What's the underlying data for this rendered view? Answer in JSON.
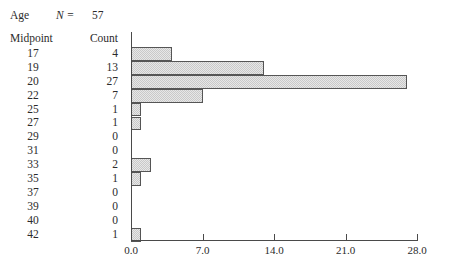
{
  "header": {
    "variable_label": "Age",
    "n_label": "N =",
    "n_value": "57"
  },
  "table": {
    "columns": [
      "Midpoint",
      "Count"
    ],
    "rows": [
      {
        "midpoint": "17",
        "count": "4"
      },
      {
        "midpoint": "19",
        "count": "13"
      },
      {
        "midpoint": "20",
        "count": "27"
      },
      {
        "midpoint": "22",
        "count": "7"
      },
      {
        "midpoint": "25",
        "count": "1"
      },
      {
        "midpoint": "27",
        "count": "1"
      },
      {
        "midpoint": "29",
        "count": "0"
      },
      {
        "midpoint": "31",
        "count": "0"
      },
      {
        "midpoint": "33",
        "count": "2"
      },
      {
        "midpoint": "35",
        "count": "1"
      },
      {
        "midpoint": "37",
        "count": "0"
      },
      {
        "midpoint": "39",
        "count": "0"
      },
      {
        "midpoint": "40",
        "count": "0"
      },
      {
        "midpoint": "42",
        "count": "1"
      }
    ]
  },
  "axis": {
    "tick_labels": [
      "0.0",
      "7.0",
      "14.0",
      "21.0",
      "28.0"
    ],
    "tick_values": [
      0,
      7,
      14,
      21,
      28
    ]
  },
  "colors": {
    "bar_fill": "#c9c9c9",
    "bar_border": "#555555",
    "axis": "#4a4a4a",
    "text": "#2b2b2b",
    "background": "#ffffff"
  },
  "chart_data": {
    "type": "bar",
    "orientation": "horizontal",
    "title": "",
    "subtitle": "",
    "xlabel": "",
    "ylabel": "",
    "categories": [
      "17",
      "19",
      "20",
      "22",
      "25",
      "27",
      "29",
      "31",
      "33",
      "35",
      "37",
      "39",
      "40",
      "42"
    ],
    "values": [
      4,
      13,
      27,
      7,
      1,
      1,
      0,
      0,
      2,
      1,
      0,
      0,
      0,
      1
    ],
    "series": [
      {
        "name": "Count",
        "values": [
          4,
          13,
          27,
          7,
          1,
          1,
          0,
          0,
          2,
          1,
          0,
          0,
          0,
          1
        ]
      }
    ],
    "xlim": [
      0,
      28
    ],
    "ylim": null,
    "xticks": [
      0,
      7,
      14,
      21,
      28
    ],
    "xticklabels": [
      "0.0",
      "7.0",
      "14.0",
      "21.0",
      "28.0"
    ],
    "grid": false,
    "legend": false,
    "annotations": [
      "Age",
      "N = 57"
    ],
    "n_total": 57
  }
}
